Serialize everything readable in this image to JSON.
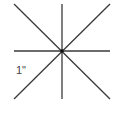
{
  "diagram": {
    "title": "",
    "label": "1\"",
    "line_color": "#3a3a3a",
    "center": [
      62,
      51
    ],
    "lines": [
      {
        "name": "vertical",
        "x1": 62,
        "y1": 4,
        "x2": 62,
        "y2": 99
      },
      {
        "name": "horizontal",
        "x1": 14,
        "y1": 51,
        "x2": 110,
        "y2": 51
      },
      {
        "name": "diagonal-down",
        "x1": 14,
        "y1": 4,
        "x2": 110,
        "y2": 99
      },
      {
        "name": "diagonal-up",
        "x1": 110,
        "y1": 4,
        "x2": 14,
        "y2": 99
      }
    ]
  }
}
